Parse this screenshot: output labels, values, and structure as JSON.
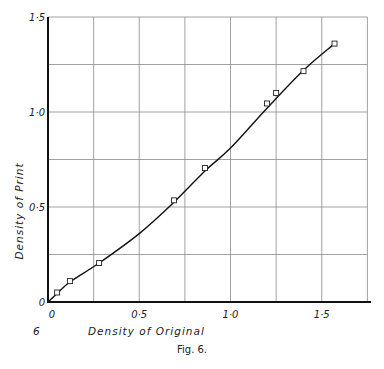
{
  "chart_data": {
    "type": "line",
    "title": "",
    "xlabel": "Density of Original",
    "ylabel": "Density of Print",
    "figure_number_left": "6",
    "caption": "Fig. 6.",
    "xlim": [
      0,
      1.75
    ],
    "ylim": [
      0,
      1.5
    ],
    "grid": true,
    "grid_step": 0.25,
    "x_tick_labels": [
      {
        "value": 0,
        "label": "0"
      },
      {
        "value": 0.5,
        "label": "0·5"
      },
      {
        "value": 1.0,
        "label": "1·0"
      },
      {
        "value": 1.5,
        "label": "1·5"
      }
    ],
    "y_tick_labels": [
      {
        "value": 0,
        "label": "0"
      },
      {
        "value": 0.5,
        "label": "0·5"
      },
      {
        "value": 1.0,
        "label": "1·0"
      },
      {
        "value": 1.5,
        "label": "1·5"
      }
    ],
    "series": [
      {
        "name": "Measured points",
        "marker": "square",
        "x": [
          0.05,
          0.12,
          0.28,
          0.69,
          0.86,
          1.2,
          1.25,
          1.4,
          1.57
        ],
        "y": [
          0.05,
          0.11,
          0.205,
          0.535,
          0.705,
          1.045,
          1.1,
          1.215,
          1.36
        ]
      },
      {
        "name": "Fitted curve",
        "marker": "none",
        "x": [
          0,
          0.05,
          0.12,
          0.28,
          0.5,
          0.69,
          0.86,
          1.0,
          1.2,
          1.4,
          1.57
        ],
        "y": [
          0,
          0.045,
          0.105,
          0.205,
          0.36,
          0.525,
          0.69,
          0.81,
          1.02,
          1.22,
          1.36
        ]
      }
    ]
  }
}
